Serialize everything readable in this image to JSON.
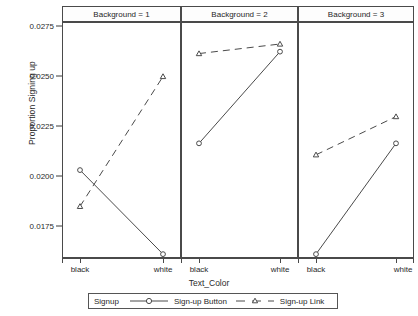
{
  "chart_data": {
    "type": "line",
    "title": "",
    "xlabel": "Text_Color",
    "ylabel": "Proportion Signing up",
    "ylim": [
      0.01625,
      0.0285
    ],
    "yticks": [
      0.0175,
      0.02,
      0.0225,
      0.025,
      0.0275
    ],
    "ytick_labels": [
      "0.0175",
      "0.0200",
      "0.0225",
      "0.0250",
      "0.0275"
    ],
    "categories": [
      "black",
      "white"
    ],
    "grid": false,
    "legend_position": "bottom",
    "legend_title": "Signup",
    "facet_variable": "Background",
    "panels": [
      {
        "label": "Background = 1",
        "series": [
          {
            "name": "Sign-up Button",
            "values": [
              0.0208,
              0.0164
            ]
          },
          {
            "name": "Sign-up Link",
            "values": [
              0.0189,
              0.0257
            ]
          }
        ]
      },
      {
        "label": "Background = 2",
        "series": [
          {
            "name": "Sign-up Button",
            "values": [
              0.0222,
              0.027
            ]
          },
          {
            "name": "Sign-up Link",
            "values": [
              0.0269,
              0.0274
            ]
          }
        ]
      },
      {
        "label": "Background = 3",
        "series": [
          {
            "name": "Sign-up Button",
            "values": [
              0.0164,
              0.0222
            ]
          },
          {
            "name": "Sign-up Link",
            "values": [
              0.0216,
              0.0236
            ]
          }
        ]
      }
    ],
    "series_styles": [
      {
        "name": "Sign-up Button",
        "line": "solid",
        "marker": "circle",
        "color": "#4a4a4a"
      },
      {
        "name": "Sign-up Link",
        "line": "dashed",
        "marker": "triangle",
        "color": "#4a4a4a"
      }
    ]
  },
  "yticks": {
    "t0": "0.0175",
    "t1": "0.0200",
    "t2": "0.0225",
    "t3": "0.0250",
    "t4": "0.0275"
  },
  "axis": {
    "ylabel": "Proportion Signing up",
    "xlabel": "Text_Color"
  },
  "panels": {
    "p0": "Background = 1",
    "p1": "Background = 2",
    "p2": "Background = 3"
  },
  "xticks": {
    "p0_black": "black",
    "p0_white": "white",
    "p1_black": "black",
    "p1_white": "white",
    "p2_black": "black",
    "p2_white": "white"
  },
  "legend": {
    "title": "Signup",
    "entry1": "Sign-up Button",
    "entry2": "Sign-up Link"
  },
  "top_clip": {
    "a": "",
    "b": "",
    "c": ""
  }
}
